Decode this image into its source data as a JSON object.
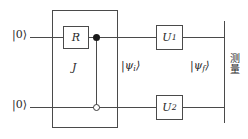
{
  "diagram": {
    "type": "quantum-circuit",
    "title": "",
    "colors": {
      "wire": "#4a4a4a",
      "box_border": "#4a4a4a",
      "text": "#2a2a2a",
      "control_filled": "#1a1a1a",
      "background": "#ffffff"
    },
    "qubits": [
      {
        "id": "q0",
        "init_label": "|0⟩",
        "position": "top"
      },
      {
        "id": "q1",
        "init_label": "|0⟩",
        "position": "bottom"
      }
    ],
    "outer_block": {
      "label": "J",
      "description": "grouping box enclosing R gate and controlled-phase operation"
    },
    "gates": [
      {
        "name": "R",
        "label": "R",
        "on": "q0"
      },
      {
        "name": "U1",
        "label": "U",
        "sub": "1",
        "on": "q0"
      },
      {
        "name": "U2",
        "label": "U",
        "sub": "2",
        "on": "q1"
      }
    ],
    "controls": [
      {
        "kind": "filled-control",
        "on": "q0"
      },
      {
        "kind": "open-control",
        "on": "q1"
      }
    ],
    "state_labels": [
      {
        "name": "psi-initial",
        "text": "|ψ",
        "sub": "i",
        "close": "⟩"
      },
      {
        "name": "psi-final",
        "text": "|ψ",
        "sub": "f",
        "close": "⟩"
      }
    ],
    "state_i_pre": "|ψ",
    "state_i_sub": "i",
    "state_i_post": "⟩",
    "state_f_pre": "|ψ",
    "state_f_sub": "f",
    "state_f_post": "⟩",
    "measurement": {
      "label": "测量",
      "orientation": "vertical",
      "description": "measurement barrier at right edge"
    },
    "gate_r_label": "R",
    "gate_u1_label": "U",
    "gate_u1_sub": "1",
    "gate_u2_label": "U",
    "gate_u2_sub": "2",
    "jbox_label": "J",
    "ket_zero": "|0⟩"
  }
}
